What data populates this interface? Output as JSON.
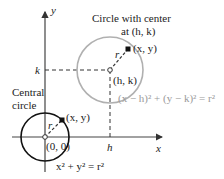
{
  "diagram": {
    "axes": {
      "x_label": "x",
      "y_label": "y"
    },
    "translated_circle": {
      "title_line1": "Circle with center",
      "title_line2": "at (h, k)",
      "center_label": "(h, k)",
      "point_label": "(x, y)",
      "radius_label": "r",
      "equation": "(x − h)² + (y − k)² = r²",
      "color": "#b0b0b0"
    },
    "central_circle": {
      "title_line1": "Central",
      "title_line2": "circle",
      "center_label": "(0, 0)",
      "point_label": "(x, y)",
      "radius_label": "r",
      "equation": "x² + y² = r²",
      "color": "#111111"
    },
    "guides": {
      "k_label": "k",
      "h_label": "h"
    }
  }
}
